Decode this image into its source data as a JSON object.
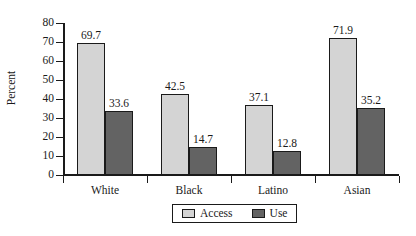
{
  "chart_data": {
    "type": "bar",
    "title": "",
    "subtitle": "",
    "xlabel": "",
    "ylabel": "Percent",
    "ylim": [
      0,
      80
    ],
    "ytick_step": 10,
    "yticks": [
      "0",
      "10",
      "20",
      "30",
      "40",
      "50",
      "60",
      "70",
      "80"
    ],
    "grid": false,
    "legend_position": "bottom-center",
    "categories": [
      "White",
      "Black",
      "Latino",
      "Asian"
    ],
    "series": [
      {
        "name": "Access",
        "color": "#d4d4d4",
        "values": [
          69.7,
          42.5,
          37.1,
          71.9
        ],
        "labels": [
          "69.7",
          "42.5",
          "37.1",
          "71.9"
        ]
      },
      {
        "name": "Use",
        "color": "#636363",
        "values": [
          33.6,
          14.7,
          12.8,
          35.2
        ],
        "labels": [
          "33.6",
          "14.7",
          "12.8",
          "35.2"
        ]
      }
    ]
  },
  "legend": {
    "items": [
      {
        "label": "Access",
        "color": "#d4d4d4"
      },
      {
        "label": "Use",
        "color": "#636363"
      }
    ]
  },
  "colors": {
    "axis": "#1a1a1a",
    "text": "#1a1a1a",
    "background": "#ffffff",
    "series_access": "#d4d4d4",
    "series_use": "#636363"
  }
}
